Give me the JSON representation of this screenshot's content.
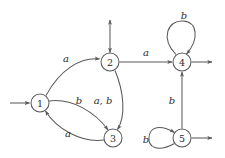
{
  "diagram": {
    "type": "state-transition-diagram",
    "colors": {
      "stroke": "#5a5a5a",
      "text": "#2b2b2b",
      "background": "#ffffff"
    },
    "alphabet": [
      "a",
      "b"
    ],
    "nodes": [
      {
        "id": "1",
        "label": "1",
        "x": 40,
        "y": 103,
        "r": 9
      },
      {
        "id": "2",
        "label": "2",
        "x": 110,
        "y": 62,
        "r": 9
      },
      {
        "id": "3",
        "label": "3",
        "x": 113,
        "y": 138,
        "r": 9
      },
      {
        "id": "4",
        "label": "4",
        "x": 182,
        "y": 62,
        "r": 9
      },
      {
        "id": "5",
        "label": "5",
        "x": 182,
        "y": 138,
        "r": 9
      }
    ],
    "edges": [
      {
        "from": "1",
        "to": "2",
        "label": "a",
        "lx": 66,
        "ly": 58
      },
      {
        "from": "1",
        "to": "3",
        "label": "b",
        "lx": 79,
        "ly": 100
      },
      {
        "from": "3",
        "to": "1",
        "label": "a",
        "lx": 68,
        "ly": 133
      },
      {
        "from": "2",
        "to": "3",
        "label": "a, b",
        "lx": 103,
        "ly": 100
      },
      {
        "from": "2",
        "to": "4",
        "label": "a",
        "lx": 146,
        "ly": 52
      },
      {
        "from": "5",
        "to": "4",
        "label": "b",
        "lx": 172,
        "ly": 100
      },
      {
        "from": "4",
        "to": "4",
        "label": "b",
        "lx": 184,
        "ly": 15,
        "kind": "self-loop"
      },
      {
        "from": "5",
        "to": "5",
        "label": "b",
        "lx": 146,
        "ly": 139,
        "kind": "self-loop"
      }
    ],
    "stubs": [
      {
        "name": "start-arrow-into-1",
        "direction": "right"
      },
      {
        "name": "stub-arrow-above-2",
        "direction": "up-down"
      },
      {
        "name": "stub-arrow-right-of-4",
        "direction": "right"
      },
      {
        "name": "stub-arrow-right-of-5",
        "direction": "right"
      }
    ]
  }
}
